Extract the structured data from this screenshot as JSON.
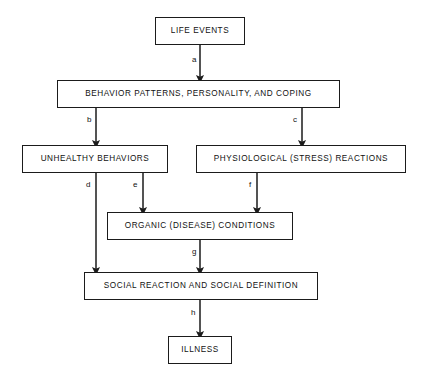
{
  "diagram": {
    "type": "flowchart",
    "orientation": "top-to-bottom",
    "canvas": {
      "width": 424,
      "height": 383
    },
    "colors": {
      "background": "#ffffff",
      "stroke": "#1b1b1b",
      "text": "#111111"
    },
    "nodes": [
      {
        "id": "life_events",
        "label": "LIFE EVENTS",
        "x": 155,
        "y": 17,
        "w": 90,
        "h": 28
      },
      {
        "id": "behavior_patterns",
        "label": "BEHAVIOR PATTERNS, PERSONALITY, AND COPING",
        "x": 57,
        "y": 80,
        "w": 283,
        "h": 28
      },
      {
        "id": "unhealthy_behaviors",
        "label": "UNHEALTHY BEHAVIORS",
        "x": 22,
        "y": 145,
        "w": 146,
        "h": 28
      },
      {
        "id": "physiological_reactions",
        "label": "PHYSIOLOGICAL (STRESS) REACTIONS",
        "x": 196,
        "y": 145,
        "w": 210,
        "h": 28
      },
      {
        "id": "organic_conditions",
        "label": "ORGANIC (DISEASE) CONDITIONS",
        "x": 107,
        "y": 212,
        "w": 186,
        "h": 28
      },
      {
        "id": "social_reaction",
        "label": "SOCIAL REACTION AND SOCIAL DEFINITION",
        "x": 84,
        "y": 272,
        "w": 234,
        "h": 28
      },
      {
        "id": "illness",
        "label": "ILLNESS",
        "x": 168,
        "y": 336,
        "w": 64,
        "h": 28
      }
    ],
    "edges": [
      {
        "id": "edge_a",
        "label": "a",
        "from": "life_events",
        "to": "behavior_patterns",
        "x": 200,
        "y1": 45,
        "y2": 80,
        "label_x": 192,
        "label_y": 56
      },
      {
        "id": "edge_b",
        "label": "b",
        "from": "behavior_patterns",
        "to": "unhealthy_behaviors",
        "x": 96,
        "y1": 108,
        "y2": 145,
        "label_x": 87,
        "label_y": 116
      },
      {
        "id": "edge_c",
        "label": "c",
        "from": "behavior_patterns",
        "to": "physiological_reactions",
        "x": 302,
        "y1": 108,
        "y2": 145,
        "label_x": 293,
        "label_y": 116
      },
      {
        "id": "edge_d",
        "label": "d",
        "from": "unhealthy_behaviors",
        "to": "social_reaction",
        "x": 96,
        "y1": 173,
        "y2": 272,
        "label_x": 86,
        "label_y": 181
      },
      {
        "id": "edge_e",
        "label": "e",
        "from": "unhealthy_behaviors",
        "to": "organic_conditions",
        "x": 143,
        "y1": 173,
        "y2": 212,
        "label_x": 133,
        "label_y": 181
      },
      {
        "id": "edge_f",
        "label": "f",
        "from": "physiological_reactions",
        "to": "organic_conditions",
        "x": 257,
        "y1": 173,
        "y2": 212,
        "label_x": 249,
        "label_y": 181
      },
      {
        "id": "edge_g",
        "label": "g",
        "from": "organic_conditions",
        "to": "social_reaction",
        "x": 200,
        "y1": 240,
        "y2": 272,
        "label_x": 192,
        "label_y": 248
      },
      {
        "id": "edge_h",
        "label": "h",
        "from": "social_reaction",
        "to": "illness",
        "x": 200,
        "y1": 300,
        "y2": 336,
        "label_x": 191,
        "label_y": 309
      }
    ]
  }
}
